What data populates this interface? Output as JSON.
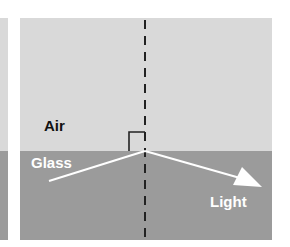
{
  "diagram": {
    "type": "refraction",
    "media": {
      "upper": {
        "label": "Air",
        "color": "#d9d9d9",
        "text_color": "#111111"
      },
      "lower": {
        "label": "Glass",
        "color": "#9b9b9b",
        "text_color": "#ffffff"
      }
    },
    "ray": {
      "label": "Light",
      "color": "#ffffff",
      "text_color": "#ffffff"
    },
    "normal": {
      "style": "dashed",
      "color": "#222222"
    },
    "right_angle_marker": {
      "color": "#222222"
    }
  }
}
